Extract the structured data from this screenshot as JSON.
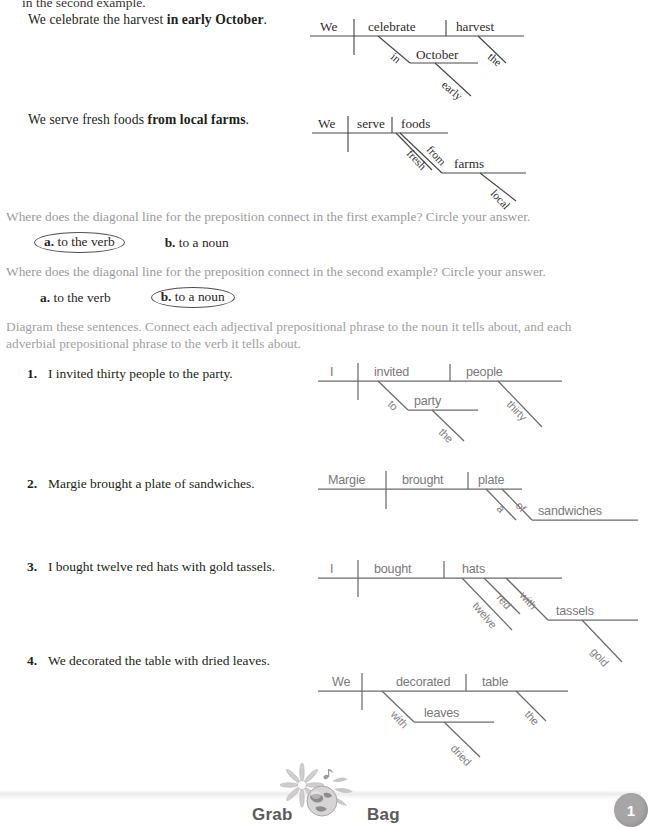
{
  "page": {
    "cut_off_top_line": "in the second example.",
    "footer_label": "Grab Bag",
    "page_number": "1"
  },
  "examples": [
    {
      "sentence_prefix": "We celebrate the harvest ",
      "sentence_bold": "in early October",
      "sentence_suffix": ".",
      "diagram": {
        "subject": "We",
        "verb": "celebrate",
        "object": "harvest",
        "object_modifier": "the",
        "preposition": "in",
        "prep_object": "October",
        "prep_object_modifier": "early"
      }
    },
    {
      "sentence_prefix": "We serve fresh foods ",
      "sentence_bold": "from local farms",
      "sentence_suffix": ".",
      "diagram": {
        "subject": "We",
        "verb": "serve",
        "object": "foods",
        "object_modifier": "fresh",
        "preposition": "from",
        "prep_object": "farms",
        "prep_object_modifier": "local"
      }
    }
  ],
  "questions": [
    {
      "prompt": "Where does the diagonal line for the preposition connect in the first example? Circle your answer.",
      "option_a_letter": "a.",
      "option_a_text": "to the verb",
      "option_b_letter": "b.",
      "option_b_text": "to a noun",
      "circled": "a"
    },
    {
      "prompt": "Where does the diagonal line for the preposition connect in the second example? Circle your answer.",
      "option_a_letter": "a.",
      "option_a_text": "to the verb",
      "option_b_letter": "b.",
      "option_b_text": "to a noun",
      "circled": "b"
    }
  ],
  "instructions": "Diagram these sentences. Connect each adjectival prepositional phrase to the noun it tells about, and each adverbial prepositional phrase to the verb it tells about.",
  "exercises": [
    {
      "number": "1.",
      "sentence": "I invited thirty people to the party.",
      "diagram": {
        "subject": "I",
        "verb": "invited",
        "object": "people",
        "object_modifier": "thirty",
        "preposition": "to",
        "prep_object": "party",
        "prep_object_modifier": "the"
      }
    },
    {
      "number": "2.",
      "sentence": "Margie brought a plate of sandwiches.",
      "diagram": {
        "subject": "Margie",
        "verb": "brought",
        "object": "plate",
        "object_modifier": "a",
        "preposition": "of",
        "prep_object": "sandwiches",
        "prep_object_modifier": ""
      }
    },
    {
      "number": "3.",
      "sentence": "I bought twelve red hats with gold tassels.",
      "diagram": {
        "subject": "I",
        "verb": "bought",
        "object": "hats",
        "object_modifier_1": "twelve",
        "object_modifier_2": "red",
        "preposition": "with",
        "prep_object": "tassels",
        "prep_object_modifier": "gold"
      }
    },
    {
      "number": "4.",
      "sentence": "We decorated the table with dried leaves.",
      "diagram": {
        "subject": "We",
        "verb": "decorated",
        "object": "table",
        "object_modifier": "the",
        "preposition": "with",
        "prep_object": "leaves",
        "prep_object_modifier": "dried"
      }
    }
  ]
}
